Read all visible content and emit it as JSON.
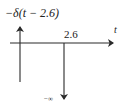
{
  "diagram": {
    "function_label": "−δ(t − 2.6)",
    "axis_label": "t",
    "impulse_location_label": "2.6",
    "impulse_magnitude_label": "−∞",
    "colors": {
      "stroke": "#2a2a2a",
      "text": "#222222",
      "background": "#ffffff"
    }
  }
}
